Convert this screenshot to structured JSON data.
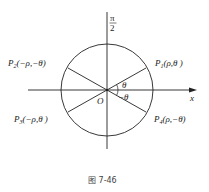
{
  "diagram": {
    "axis_top_label_num": "π",
    "axis_top_label_den": "2",
    "axis_x_label": "x",
    "origin_label": "O",
    "angle_pos_label": "θ",
    "angle_neg_label": "−θ",
    "points": [
      {
        "id": "P1",
        "name": "P",
        "sub": "1",
        "coords": "(ρ,θ )"
      },
      {
        "id": "P2",
        "name": "P",
        "sub": "2",
        "coords": "(−ρ,−θ)"
      },
      {
        "id": "P3",
        "name": "P",
        "sub": "3",
        "coords": "(−ρ,θ )"
      },
      {
        "id": "P4",
        "name": "P",
        "sub": "4",
        "coords": "(ρ,−θ)"
      }
    ],
    "caption": "图 7-46"
  }
}
